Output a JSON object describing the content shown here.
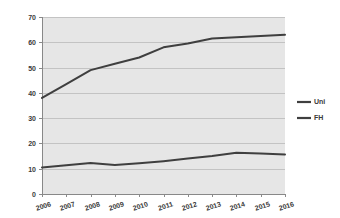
{
  "chart_data": {
    "type": "line",
    "title": "",
    "subtitle": "",
    "xlabel": "",
    "ylabel": "",
    "categories": [
      "2006",
      "2007",
      "2008",
      "2009",
      "2010",
      "2011",
      "2012",
      "2013",
      "2014",
      "2015",
      "2016"
    ],
    "x": [
      2006,
      2007,
      2008,
      2009,
      2010,
      2011,
      2012,
      2013,
      2014,
      2015,
      2016
    ],
    "series": [
      {
        "name": "Uni",
        "color": "#3f3f3f",
        "values": [
          38,
          43.5,
          49,
          51.5,
          54,
          58,
          59.5,
          61.5,
          62,
          62.5,
          63
        ]
      },
      {
        "name": "FH",
        "color": "#3f3f3f",
        "values": [
          10.5,
          11.4,
          12.3,
          11.5,
          12.2,
          13,
          14,
          15,
          16.3,
          16,
          15.6
        ]
      }
    ],
    "ylim": [
      0,
      70
    ],
    "yticks": [
      0,
      10,
      20,
      30,
      40,
      50,
      60,
      70
    ],
    "ytick_labels": [
      "0",
      "10",
      "20",
      "30",
      "40",
      "50",
      "60",
      "70"
    ],
    "xtick_labels": [
      "2006",
      "2007",
      "2008",
      "2009",
      "2010",
      "2011",
      "2012",
      "2013",
      "2014",
      "2015",
      "2016"
    ],
    "grid": true,
    "grid_axis": "y",
    "legend": true,
    "legend_position": "right",
    "legend_entries": [
      "Uni",
      "FH"
    ],
    "plot_background": "#e6e6e6",
    "figure_background": "#ffffff",
    "grid_color": "#c3c3c3",
    "axis_color": "#888888"
  }
}
